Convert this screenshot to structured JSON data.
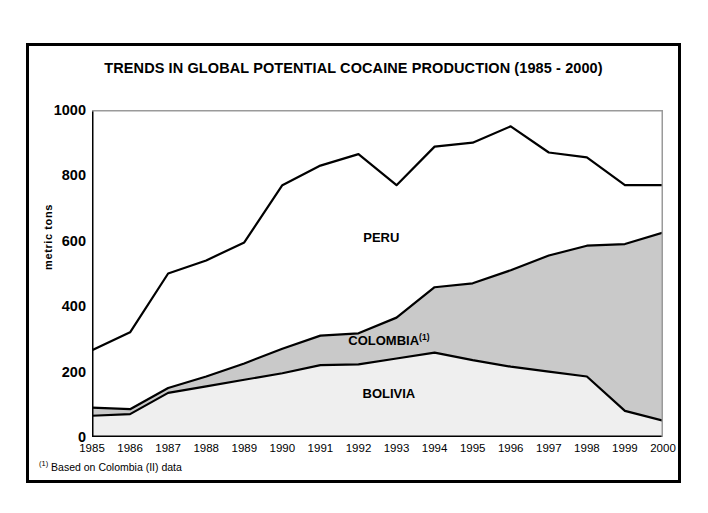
{
  "figure": {
    "title": "TRENDS IN GLOBAL POTENTIAL COCAINE PRODUCTION (1985 - 2000)",
    "footnote_marker": "(1)",
    "footnote_text": " Based on Colombia (II) data",
    "frame_color": "#000000",
    "background_color": "#ffffff"
  },
  "chart_data": {
    "type": "area",
    "stacked": true,
    "title": "TRENDS IN GLOBAL POTENTIAL COCAINE PRODUCTION (1985 - 2000)",
    "xlabel": "",
    "ylabel": "metric tons",
    "xlim": [
      1985,
      2000
    ],
    "ylim": [
      0,
      1000
    ],
    "yticks": [
      0,
      200,
      400,
      600,
      800,
      1000
    ],
    "ytick_labels": [
      "0",
      "200",
      "400",
      "600",
      "800",
      "1000"
    ],
    "x": [
      1985,
      1986,
      1987,
      1988,
      1989,
      1990,
      1991,
      1992,
      1993,
      1994,
      1995,
      1996,
      1997,
      1998,
      1999,
      2000
    ],
    "xtick_labels": [
      "1985",
      "1986",
      "1987",
      "1988",
      "1989",
      "1990",
      "1991",
      "1992",
      "1993",
      "1994",
      "1995",
      "1996",
      "1997",
      "1998",
      "1999",
      "2000"
    ],
    "grid": false,
    "legend_position": "inside-annotations",
    "series": [
      {
        "name": "BOLIVIA",
        "label": "BOLIVIA",
        "fill_color": "#efefef",
        "line_color": "#000000",
        "order": 1,
        "values": [
          65,
          70,
          135,
          155,
          175,
          195,
          220,
          222,
          240,
          258,
          235,
          215,
          200,
          185,
          80,
          50
        ]
      },
      {
        "name": "COLOMBIA",
        "label": "COLOMBIA",
        "label_superscript": "(1)",
        "fill_color": "#c9c9c9",
        "line_color": "#000000",
        "order": 2,
        "values": [
          25,
          15,
          15,
          30,
          50,
          75,
          90,
          95,
          125,
          200,
          235,
          295,
          355,
          400,
          510,
          575
        ]
      },
      {
        "name": "PERU",
        "label": "PERU",
        "fill_color": "#ffffff",
        "line_color": "#000000",
        "order": 3,
        "values": [
          175,
          235,
          350,
          355,
          370,
          500,
          520,
          550,
          405,
          430,
          430,
          440,
          315,
          270,
          180,
          145
        ]
      }
    ],
    "cumulative": {
      "bolivia_top": [
        65,
        70,
        135,
        155,
        175,
        195,
        220,
        222,
        240,
        258,
        235,
        215,
        200,
        185,
        80,
        50
      ],
      "colombia_top": [
        90,
        85,
        150,
        185,
        225,
        270,
        310,
        317,
        365,
        458,
        470,
        510,
        555,
        585,
        590,
        625
      ],
      "total_top": [
        265,
        320,
        500,
        540,
        595,
        770,
        830,
        865,
        770,
        888,
        900,
        950,
        870,
        855,
        770,
        770
      ]
    },
    "annotations": [
      {
        "text": "PERU",
        "x": 1992.6,
        "y": 610
      },
      {
        "text": "COLOMBIA (1)",
        "x": 1992.8,
        "y": 297
      },
      {
        "text": "BOLIVIA",
        "x": 1992.8,
        "y": 132
      }
    ]
  }
}
